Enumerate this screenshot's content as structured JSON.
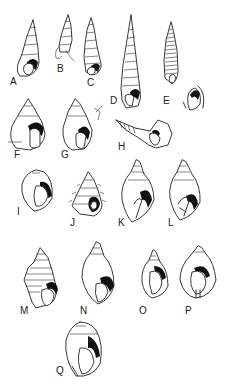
{
  "figure": {
    "background": "#ffffff",
    "ink_color": "#222222",
    "specimens": [
      {
        "id": "A",
        "label": "A",
        "form": "turreted, small aperture"
      },
      {
        "id": "B",
        "label": "B",
        "form": "slender turreted, broken body whorl"
      },
      {
        "id": "C",
        "label": "C",
        "form": "slender turreted"
      },
      {
        "id": "D",
        "label": "D",
        "form": "very elongate, many spiral whorls"
      },
      {
        "id": "E",
        "label": "E",
        "form": "elongate, finely striated, with aperture detail"
      },
      {
        "id": "F",
        "label": "F",
        "form": "broad conic, large aperture"
      },
      {
        "id": "G",
        "label": "G",
        "form": "conic, rounded aperture"
      },
      {
        "id": "H",
        "label": "H",
        "form": "shell lying on side, flared lip"
      },
      {
        "id": "I",
        "label": "I",
        "form": "globose, low spire"
      },
      {
        "id": "J",
        "label": "J",
        "form": "spiny/nodose, turreted"
      },
      {
        "id": "K",
        "label": "K",
        "form": "fusiform, large body whorl"
      },
      {
        "id": "L",
        "label": "L",
        "form": "fusiform, thickened lip"
      },
      {
        "id": "M",
        "label": "M",
        "form": "spirally ribbed, shouldered"
      },
      {
        "id": "N",
        "label": "N",
        "form": "inflated body whorl, short spire"
      },
      {
        "id": "O",
        "label": "O",
        "form": "small ovate, thick lip"
      },
      {
        "id": "P",
        "label": "P",
        "form": "ovate, notched aperture"
      },
      {
        "id": "Q",
        "label": "Q",
        "form": "globose, involute"
      }
    ]
  }
}
